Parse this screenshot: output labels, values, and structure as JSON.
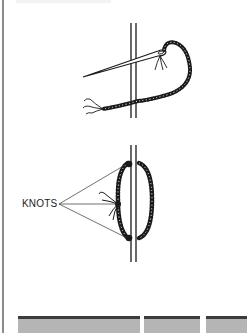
{
  "figure_top": {
    "description": "needle-threading-through-fabric",
    "elements": [
      "fabric-edge-icon",
      "needle-icon",
      "beaded-thread-icon",
      "frayed-thread-end-icon"
    ]
  },
  "figure_bottom": {
    "label": "KNOTS",
    "knot_count": 3,
    "elements": [
      "fabric-edge-icon",
      "thread-loop-icon",
      "knot-icon",
      "pointer-lines"
    ]
  },
  "bottom_strip": {
    "segments": 3,
    "fill_color": "#b5b5b5",
    "edge_color": "#3c3c3c"
  },
  "colors": {
    "ink": "#1a1a1a",
    "background": "#ffffff",
    "border": "#8a8a8a"
  }
}
